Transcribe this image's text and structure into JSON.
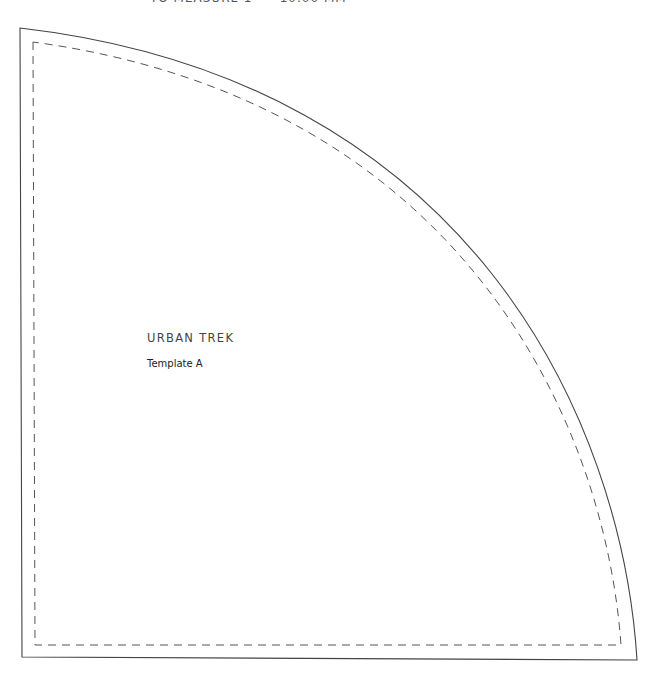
{
  "header": {
    "note": "TO MEASURE 1\" = 10.00 MM"
  },
  "template": {
    "title": "URBAN TREK",
    "subtitle": "Template A"
  },
  "colors": {
    "cut_line": "#444444",
    "seam_line": "#555555"
  }
}
